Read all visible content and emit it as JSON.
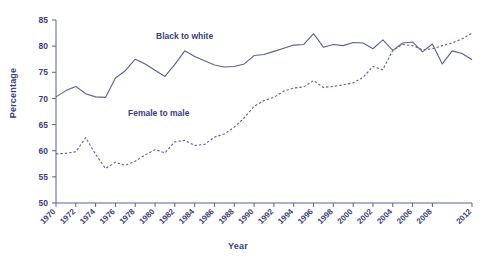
{
  "chart_data": {
    "type": "line",
    "title": "",
    "xlabel": "Year",
    "ylabel": "Percentage",
    "xlim": [
      1970,
      2012
    ],
    "ylim": [
      50,
      85
    ],
    "ytick_values": [
      50,
      55,
      60,
      65,
      70,
      75,
      80,
      85
    ],
    "xtick_values": [
      1970,
      1972,
      1974,
      1976,
      1978,
      1980,
      1982,
      1984,
      1986,
      1988,
      1990,
      1992,
      1994,
      1996,
      1998,
      2000,
      2002,
      2004,
      2006,
      2008,
      2012
    ],
    "xtick_labels": [
      "1970",
      "1972",
      "1974",
      "1976",
      "1978",
      "1980",
      "1982",
      "1984",
      "1986",
      "1988",
      "1990",
      "1992",
      "1994",
      "1996",
      "1998",
      "2000",
      "2002",
      "2004",
      "2006",
      "2008",
      "2012"
    ],
    "grid": false,
    "legend_position": "inline-annotations",
    "x": [
      1970,
      1971,
      1972,
      1973,
      1974,
      1975,
      1976,
      1977,
      1978,
      1979,
      1980,
      1981,
      1982,
      1983,
      1984,
      1985,
      1986,
      1987,
      1988,
      1989,
      1990,
      1991,
      1992,
      1993,
      1994,
      1995,
      1996,
      1997,
      1998,
      1999,
      2000,
      2001,
      2002,
      2003,
      2004,
      2005,
      2006,
      2007,
      2008,
      2009,
      2010,
      2011,
      2012
    ],
    "series": [
      {
        "name": "Black to white",
        "style": "solid",
        "color": "#5b5f96",
        "label_text": "Black to white",
        "values": [
          70.3,
          71.5,
          72.3,
          70.9,
          70.3,
          70.2,
          73.9,
          75.3,
          77.5,
          76.6,
          75.4,
          74.2,
          76.5,
          79.1,
          78.0,
          77.2,
          76.4,
          76.0,
          76.1,
          76.6,
          78.2,
          78.4,
          79.0,
          79.6,
          80.2,
          80.3,
          82.4,
          79.8,
          80.3,
          80.1,
          80.7,
          80.6,
          79.5,
          81.2,
          79.2,
          80.6,
          80.8,
          78.9,
          80.4,
          76.6,
          79.1,
          78.6,
          77.4
        ]
      },
      {
        "name": "Female to male",
        "style": "dashed",
        "color": "#5b5f96",
        "label_text": "Female to male",
        "values": [
          59.4,
          59.5,
          59.8,
          62.5,
          59.3,
          56.6,
          57.8,
          57.2,
          58.0,
          59.2,
          60.2,
          59.6,
          61.7,
          62.0,
          61.0,
          61.2,
          62.6,
          63.2,
          64.5,
          66.3,
          68.5,
          69.6,
          70.2,
          71.4,
          72.0,
          72.2,
          73.4,
          72.1,
          72.3,
          72.6,
          73.0,
          74.0,
          76.1,
          75.5,
          79.2,
          80.3,
          80.1,
          79.3,
          79.5,
          80.1,
          80.6,
          81.4,
          82.5
        ]
      }
    ]
  },
  "labels": {
    "ylabel": "Percentage",
    "xlabel": "Year",
    "series_black_to_white": "Black to white",
    "series_female_to_male": "Female to male"
  }
}
